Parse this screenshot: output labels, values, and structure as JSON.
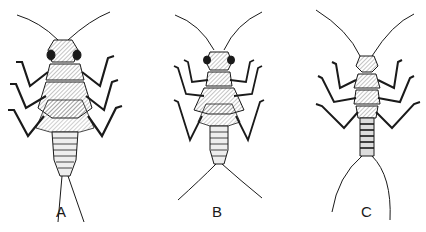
{
  "figure": {
    "ink_color": "#1a1a1a",
    "background_color": "#ffffff",
    "panels": [
      {
        "id": "A",
        "label": "A",
        "label_x": 56,
        "label_y": 203
      },
      {
        "id": "B",
        "label": "B",
        "label_x": 212,
        "label_y": 203
      },
      {
        "id": "C",
        "label": "C",
        "label_x": 361,
        "label_y": 203
      }
    ]
  }
}
